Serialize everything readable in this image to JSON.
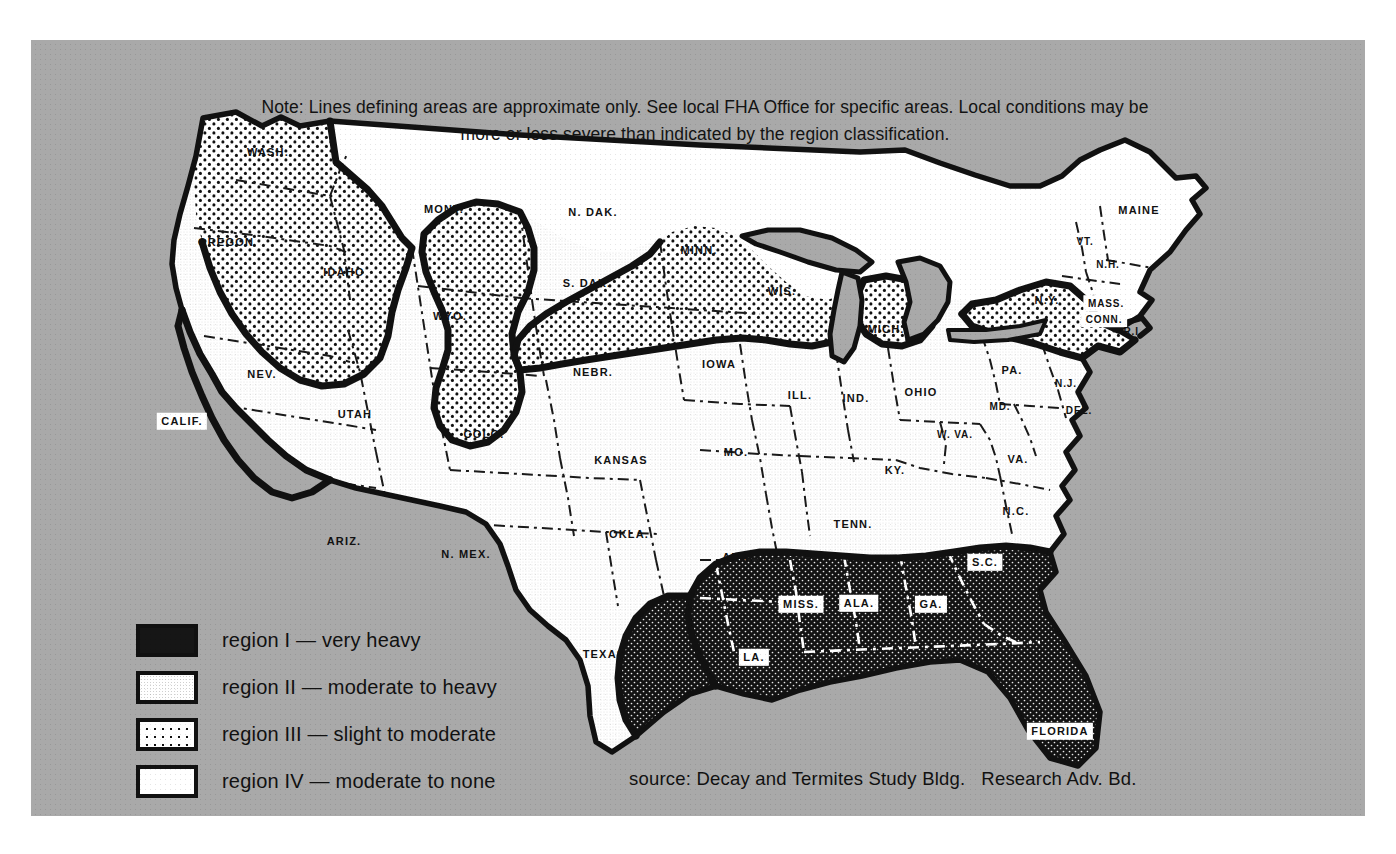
{
  "map": {
    "title": "Termite and Decay Hazard Regions of the United States",
    "note": "Note: Lines defining areas are approximate only.  See local FHA Office for specific areas.  Local conditions may be more or less severe than indicated by the region classification.",
    "source": "source: Decay and Termites Study Bldg.   Research Adv. Bd.",
    "background_color": "#a9a9a9",
    "ink_color": "#111111",
    "paper_color": "#ffffff"
  },
  "legend": {
    "items": [
      {
        "swatch": "region-i-very-heavy",
        "label": "region I — very heavy",
        "pattern": "solid-black",
        "color": "#161616"
      },
      {
        "swatch": "region-ii-moderate-heavy",
        "label": "region II — moderate to heavy",
        "pattern": "fine-stipple",
        "color": "#ffffff"
      },
      {
        "swatch": "region-iii-slight-moderate",
        "label": "region III — slight to moderate",
        "pattern": "coarse-dots",
        "color": "#ffffff"
      },
      {
        "swatch": "region-iv-moderate-none",
        "label": "region IV — moderate to none",
        "pattern": "plain-white",
        "color": "#ffffff"
      }
    ]
  },
  "states": [
    {
      "name": "WASH.",
      "x": 268,
      "y": 152,
      "region": 3,
      "boxed": false,
      "size": "sm"
    },
    {
      "name": "OREGON",
      "x": 226,
      "y": 242,
      "region": 3,
      "boxed": false,
      "size": "sm"
    },
    {
      "name": "IDAHO",
      "x": 344,
      "y": 272,
      "region": 3,
      "boxed": false,
      "size": "sm"
    },
    {
      "name": "MONT.",
      "x": 444,
      "y": 209,
      "region": 4,
      "boxed": false,
      "size": "sm"
    },
    {
      "name": "WYO.",
      "x": 450,
      "y": 316,
      "region": 4,
      "boxed": false,
      "size": "sm"
    },
    {
      "name": "N. DAK.",
      "x": 593,
      "y": 212,
      "region": 4,
      "boxed": false,
      "size": "sm"
    },
    {
      "name": "S. DAK.",
      "x": 587,
      "y": 283,
      "region": 4,
      "boxed": false,
      "size": "sm"
    },
    {
      "name": "MINN.",
      "x": 699,
      "y": 250,
      "region": 3,
      "boxed": false,
      "size": "sm"
    },
    {
      "name": "WIS.",
      "x": 782,
      "y": 291,
      "region": 3,
      "boxed": false,
      "size": "sm"
    },
    {
      "name": "MICH.",
      "x": 886,
      "y": 329,
      "region": 3,
      "boxed": false,
      "size": "sm"
    },
    {
      "name": "NEV.",
      "x": 262,
      "y": 374,
      "region": 2,
      "boxed": false,
      "size": "sm"
    },
    {
      "name": "UTAH",
      "x": 355,
      "y": 414,
      "region": 2,
      "boxed": false,
      "size": "sm"
    },
    {
      "name": "COLO.",
      "x": 484,
      "y": 434,
      "region": 3,
      "boxed": false,
      "size": "sm"
    },
    {
      "name": "NEBR.",
      "x": 593,
      "y": 372,
      "region": 2,
      "boxed": false,
      "size": "sm"
    },
    {
      "name": "IOWA",
      "x": 719,
      "y": 364,
      "region": 2,
      "boxed": false,
      "size": "sm"
    },
    {
      "name": "CALIF.",
      "x": 182,
      "y": 421,
      "region": 1,
      "boxed": true,
      "size": "sm"
    },
    {
      "name": "ARIZ.",
      "x": 344,
      "y": 541,
      "region": 2,
      "boxed": false,
      "size": "sm"
    },
    {
      "name": "N. MEX.",
      "x": 466,
      "y": 554,
      "region": 2,
      "boxed": false,
      "size": "sm"
    },
    {
      "name": "KANSAS",
      "x": 621,
      "y": 460,
      "region": 2,
      "boxed": false,
      "size": "sm"
    },
    {
      "name": "OKLA.",
      "x": 629,
      "y": 534,
      "region": 2,
      "boxed": false,
      "size": "sm"
    },
    {
      "name": "TEXAS",
      "x": 604,
      "y": 654,
      "region": 2,
      "boxed": false,
      "size": "sm"
    },
    {
      "name": "MO.",
      "x": 736,
      "y": 452,
      "region": 2,
      "boxed": false,
      "size": "sm"
    },
    {
      "name": "ARK.",
      "x": 738,
      "y": 557,
      "region": 2,
      "boxed": false,
      "size": "sm"
    },
    {
      "name": "ILL.",
      "x": 800,
      "y": 395,
      "region": 2,
      "boxed": false,
      "size": "sm"
    },
    {
      "name": "IND.",
      "x": 856,
      "y": 398,
      "region": 2,
      "boxed": false,
      "size": "sm"
    },
    {
      "name": "OHIO",
      "x": 921,
      "y": 392,
      "region": 2,
      "boxed": false,
      "size": "sm"
    },
    {
      "name": "KY.",
      "x": 895,
      "y": 470,
      "region": 2,
      "boxed": false,
      "size": "sm"
    },
    {
      "name": "TENN.",
      "x": 853,
      "y": 524,
      "region": 2,
      "boxed": false,
      "size": "sm"
    },
    {
      "name": "W. VA.",
      "x": 955,
      "y": 434,
      "region": 2,
      "boxed": false,
      "size": "xs"
    },
    {
      "name": "VA.",
      "x": 1018,
      "y": 459,
      "region": 2,
      "boxed": false,
      "size": "sm"
    },
    {
      "name": "N.C.",
      "x": 1016,
      "y": 511,
      "region": 2,
      "boxed": false,
      "size": "sm"
    },
    {
      "name": "PA.",
      "x": 1012,
      "y": 370,
      "region": 2,
      "boxed": false,
      "size": "sm"
    },
    {
      "name": "MD.",
      "x": 1000,
      "y": 406,
      "region": 2,
      "boxed": false,
      "size": "xs"
    },
    {
      "name": "DEL.",
      "x": 1079,
      "y": 410,
      "region": 2,
      "boxed": false,
      "size": "xs"
    },
    {
      "name": "N.J.",
      "x": 1066,
      "y": 383,
      "region": 2,
      "boxed": false,
      "size": "xs"
    },
    {
      "name": "N.Y.",
      "x": 1047,
      "y": 300,
      "region": 3,
      "boxed": false,
      "size": "sm"
    },
    {
      "name": "VT.",
      "x": 1085,
      "y": 241,
      "region": 4,
      "boxed": false,
      "size": "xs"
    },
    {
      "name": "N.H.",
      "x": 1108,
      "y": 264,
      "region": 4,
      "boxed": false,
      "size": "xs"
    },
    {
      "name": "MAINE",
      "x": 1139,
      "y": 210,
      "region": 4,
      "boxed": false,
      "size": "sm"
    },
    {
      "name": "MASS.",
      "x": 1106,
      "y": 303,
      "region": 3,
      "boxed": true,
      "size": "xs"
    },
    {
      "name": "CONN.",
      "x": 1104,
      "y": 319,
      "region": 3,
      "boxed": true,
      "size": "xs"
    },
    {
      "name": "R.I.",
      "x": 1133,
      "y": 331,
      "region": 3,
      "boxed": false,
      "size": "xs"
    },
    {
      "name": "MISS.",
      "x": 801,
      "y": 604,
      "region": 1,
      "boxed": true,
      "size": "sm"
    },
    {
      "name": "ALA.",
      "x": 859,
      "y": 603,
      "region": 1,
      "boxed": true,
      "size": "sm"
    },
    {
      "name": "GA.",
      "x": 931,
      "y": 604,
      "region": 1,
      "boxed": true,
      "size": "sm"
    },
    {
      "name": "S.C.",
      "x": 985,
      "y": 562,
      "region": 1,
      "boxed": true,
      "size": "sm"
    },
    {
      "name": "LA.",
      "x": 754,
      "y": 657,
      "region": 1,
      "boxed": true,
      "size": "sm"
    },
    {
      "name": "FLORIDA",
      "x": 1060,
      "y": 731,
      "region": 1,
      "boxed": true,
      "size": "sm"
    }
  ]
}
